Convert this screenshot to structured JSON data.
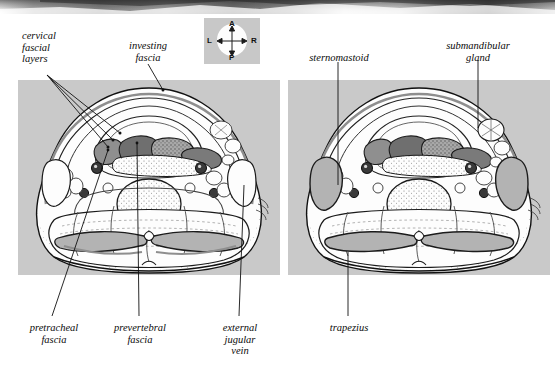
{
  "figure": {
    "type": "anatomy-cross-section",
    "panel_count": 2
  },
  "compass": {
    "name": "orientation-compass",
    "anterior": "A",
    "posterior": "P",
    "left": "L",
    "right": "R",
    "bg_color": "#c8c8c8"
  },
  "colors": {
    "panel_background": "#c9c9c9",
    "ink": "#111111",
    "fascia_gray": "#8e8e8e",
    "muscle_fill": "#b9b9b9",
    "dark_muscle": "#6e6e6e",
    "page": "#ffffff"
  },
  "labels": {
    "left_panel": [
      {
        "id": "cervical-fascial-layers",
        "text": "cervical\nfascial\nlayers",
        "align": "left",
        "x": 22,
        "y": 30
      },
      {
        "id": "investing-fascia",
        "text": "investing\nfascia",
        "align": "center",
        "x": 110,
        "y": 40
      },
      {
        "id": "pretracheal-fascia",
        "text": "pretracheal\nfascia",
        "align": "center",
        "x": 20,
        "y": 322
      },
      {
        "id": "prevertebral-fascia",
        "text": "prevertebral\nfascia",
        "align": "center",
        "x": 110,
        "y": 322
      },
      {
        "id": "external-jugular-vein",
        "text": "external\njugular\nvein",
        "align": "center",
        "x": 212,
        "y": 322
      }
    ],
    "right_panel": [
      {
        "id": "sternomastoid",
        "text": "sternomastoid",
        "align": "center",
        "x": 296,
        "y": 52
      },
      {
        "id": "submandibular-gland",
        "text": "submandibular\ngland",
        "align": "center",
        "x": 428,
        "y": 40
      },
      {
        "id": "trapezius",
        "text": "trapezius",
        "align": "center",
        "x": 330,
        "y": 322
      }
    ]
  }
}
